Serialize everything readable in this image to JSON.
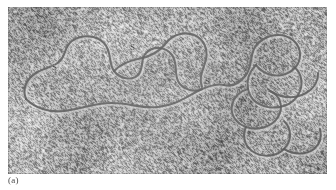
{
  "figure": {
    "kind": "electron-micrograph",
    "panel_caption": "(a)",
    "plate": {
      "x": 8,
      "y": 7,
      "width": 319,
      "height": 167,
      "background_color": "#b9b9b9",
      "grain_dark_color": "#4e4e4e",
      "grain_light_color": "#d8d8d8"
    },
    "annotations": [
      {
        "label": "S",
        "x": 44,
        "y": 56
      },
      {
        "label": "S",
        "x": 122,
        "y": 36
      },
      {
        "label": "S",
        "x": 197,
        "y": 70
      }
    ],
    "strand": {
      "stroke_color": "#555555",
      "highlight_color": "#d5d5d5",
      "stroke_width": 2.1,
      "paths": [
        "M 18 92 C 26 100, 40 106, 56 104 C 72 102, 86 96, 104 96 C 122 96, 134 102, 150 100 C 168 98, 178 90, 190 84 C 200 79, 208 76, 216 78",
        "M 18 92 C 14 82, 18 72, 28 66 C 36 61, 46 60, 52 54 C 58 48, 56 40, 64 34 C 74 27, 88 28, 96 36 C 104 44, 100 56, 106 64 C 112 72, 124 74, 130 68 C 136 62, 132 52, 138 46 C 146 38, 158 40, 164 48 C 170 56, 166 66, 170 74 C 174 82, 186 86, 194 82",
        "M 106 64 C 112 58, 120 54, 130 52 C 142 50, 152 44, 158 36 C 164 28, 176 24, 186 28 C 196 32, 200 42, 198 52 C 196 62, 190 70, 194 80",
        "M 216 78 C 224 80, 232 76, 238 68 C 244 60, 242 50, 246 42 C 250 34, 260 28, 270 28 C 282 28, 292 36, 292 48 C 292 58, 284 66, 274 68 C 264 70, 254 66, 248 58",
        "M 248 58 C 242 64, 238 72, 240 82 C 242 92, 250 98, 260 100 C 272 102, 284 98, 290 88 C 296 78, 294 66, 286 60",
        "M 240 82 C 232 84, 226 90, 224 98 C 222 108, 228 116, 238 120 C 250 124, 264 120, 270 110 C 276 100, 272 88, 262 84",
        "M 262 84 C 272 90, 284 92, 294 88 C 304 84, 310 76, 310 66",
        "M 238 120 C 234 128, 236 138, 244 144 C 254 151, 268 150, 276 142 C 284 134, 284 122, 276 114",
        "M 276 142 C 286 148, 298 148, 306 142 C 312 137, 314 130, 312 122"
      ]
    }
  }
}
